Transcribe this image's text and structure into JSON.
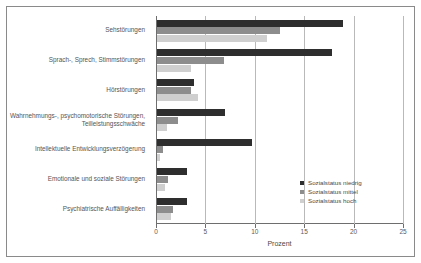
{
  "chart_data": {
    "type": "bar",
    "orientation": "horizontal",
    "title": "",
    "xlabel": "Prozent",
    "ylabel": "",
    "xlim": [
      0,
      25
    ],
    "xticks": [
      0,
      5,
      10,
      15,
      20,
      25
    ],
    "xticklabels": [
      "0",
      "5",
      "10",
      "15",
      "20",
      "25"
    ],
    "grid": true,
    "grid_axis": "x",
    "legend_position": "right-bottom",
    "categories": [
      "Sehstörungen",
      "Sprach-, Sprech, Stimmstörungen",
      "Hörstörungen",
      "Wahrnehmungs-, psychomotorische Störungen, Teilleistungsschwäche",
      "Intellektuelle Entwicklungsverzögerung",
      "Emotionale und soziale Störungen",
      "Psychiatrische Auffälligkeiten"
    ],
    "series": [
      {
        "name": "Sozialstatus niedrig",
        "color": "#2e2e2e",
        "values": [
          18.8,
          17.7,
          3.7,
          6.9,
          9.6,
          3.0,
          3.0
        ]
      },
      {
        "name": "Sozialstatus mittel",
        "color": "#8d8d8d",
        "values": [
          12.4,
          6.8,
          3.4,
          2.1,
          0.6,
          1.1,
          1.6
        ]
      },
      {
        "name": "Sozialstatus hoch",
        "color": "#cfcfcf",
        "values": [
          11.1,
          3.4,
          4.1,
          1.0,
          0.3,
          0.8,
          1.4
        ]
      }
    ]
  },
  "colors": {
    "niedrig": "#2e2e2e",
    "mittel": "#8d8d8d",
    "hoch": "#cfcfcf",
    "frame": "#8a8a8a",
    "axis": "#6e6e6e",
    "grid": "#b9b9b9"
  }
}
